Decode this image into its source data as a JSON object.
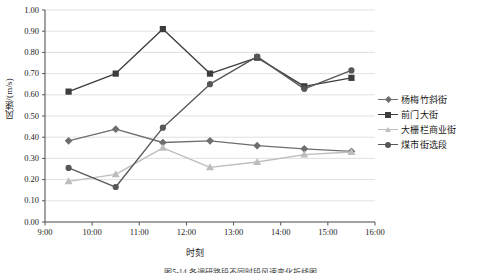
{
  "chart_data": {
    "type": "line",
    "title": "",
    "xlabel": "时刻",
    "ylabel": "风速/(m/s)",
    "ylim": [
      0.0,
      1.0
    ],
    "ytick_labels": [
      "0.00",
      "0.10",
      "0.20",
      "0.30",
      "0.40",
      "0.50",
      "0.60",
      "0.70",
      "0.80",
      "0.90",
      "1.00"
    ],
    "ytick_values": [
      0.0,
      0.1,
      0.2,
      0.3,
      0.4,
      0.5,
      0.6,
      0.7,
      0.8,
      0.9,
      1.0
    ],
    "xtick_labels": [
      "9:00",
      "10:00",
      "11:00",
      "12:00",
      "13:00",
      "14:00",
      "15:00",
      "16:00"
    ],
    "xtick_values": [
      9,
      10,
      11,
      12,
      13,
      14,
      15,
      16
    ],
    "xlim": [
      9,
      16
    ],
    "x": [
      9.5,
      10.5,
      11.5,
      12.5,
      13.5,
      14.5,
      15.5
    ],
    "x_point_labels": [
      "9:30",
      "10:30",
      "11:30",
      "12:30",
      "13:30",
      "14:30",
      "15:30"
    ],
    "grid": "horizontal",
    "legend_position": "right",
    "series": [
      {
        "name": "杨梅竹斜街",
        "color": "#6e6e6e",
        "marker": "diamond",
        "values": [
          0.383,
          0.438,
          0.375,
          0.383,
          0.36,
          0.345,
          0.333
        ]
      },
      {
        "name": "前门大街",
        "color": "#3d3d3d",
        "marker": "square",
        "values": [
          0.615,
          0.7,
          0.91,
          0.7,
          0.775,
          0.64,
          0.68
        ]
      },
      {
        "name": "大栅栏商业街",
        "color": "#bdbdbd",
        "marker": "triangle",
        "values": [
          0.192,
          0.225,
          0.35,
          0.258,
          0.283,
          0.318,
          0.33
        ]
      },
      {
        "name": "煤市街选段",
        "color": "#575757",
        "marker": "circle",
        "values": [
          0.255,
          0.165,
          0.445,
          0.65,
          0.78,
          0.628,
          0.715
        ]
      }
    ]
  },
  "caption": "图5-14 各调研路段不同时段风速变化折线图",
  "plot_area": {
    "left": 45,
    "top": 10,
    "width": 330,
    "height": 212
  }
}
